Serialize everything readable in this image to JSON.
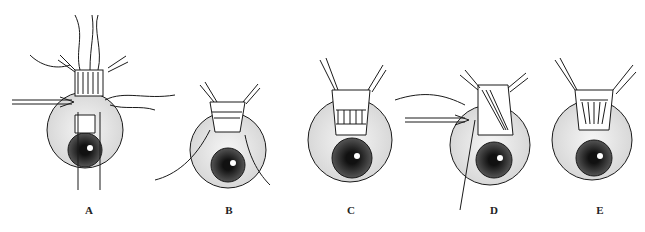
{
  "figure": {
    "panels": [
      {
        "label": "A",
        "x": 73,
        "eye_cx": 102,
        "eye_cy": 140,
        "eye_r": 42
      },
      {
        "label": "B",
        "x": 183,
        "eye_cx": 228,
        "eye_cy": 165,
        "eye_r": 38
      },
      {
        "label": "C",
        "x": 282,
        "eye_cx": 350,
        "eye_cy": 160,
        "eye_r": 42
      },
      {
        "label": "D",
        "x": 395,
        "eye_cx": 490,
        "eye_cy": 158,
        "eye_r": 40
      },
      {
        "label": "E",
        "x": 481,
        "eye_cx": 592,
        "eye_cy": 150,
        "eye_r": 40
      }
    ],
    "colors": {
      "ink": "#1a1a1a",
      "paper": "#ffffff",
      "sclera": "#e8e8e8",
      "pupil": "#222222"
    }
  }
}
